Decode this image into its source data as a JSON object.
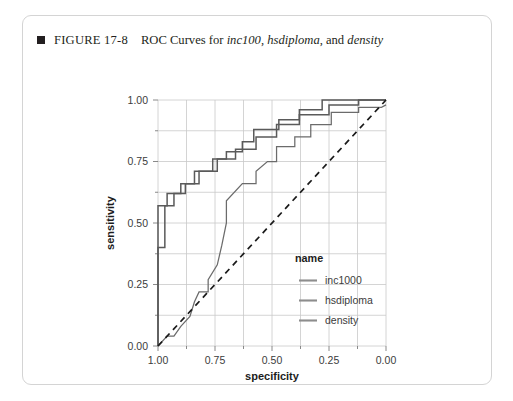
{
  "figure": {
    "marker_icon": "filled-square-icon",
    "number_label": "FIGURE 17-8",
    "caption_prefix": "ROC Curves for ",
    "caption_var1": "inc100",
    "caption_sep1": ", ",
    "caption_var2": "hsdiploma",
    "caption_sep2": ", and ",
    "caption_var3": "density",
    "caption_plain": "ROC Curves for inc100, hsdiploma, and density"
  },
  "chart_data": {
    "type": "line",
    "title": "ROC Curves for inc100, hsdiploma, and density",
    "xlabel": "specificity",
    "ylabel": "sensitivity",
    "xlim": [
      1.0,
      0.0
    ],
    "ylim": [
      0.0,
      1.0
    ],
    "x_reversed": true,
    "grid": true,
    "xticks": [
      1.0,
      0.75,
      0.5,
      0.25,
      0.0
    ],
    "xtick_labels": [
      "1.00",
      "0.75",
      "0.50",
      "0.25",
      "0.00"
    ],
    "x_minor_ticks": [
      0.875,
      0.625,
      0.375,
      0.125
    ],
    "yticks": [
      0.0,
      0.25,
      0.5,
      0.75,
      1.0
    ],
    "ytick_labels": [
      "0.00",
      "0.25",
      "0.50",
      "0.75",
      "1.00"
    ],
    "y_minor_ticks": [
      0.125,
      0.375,
      0.625,
      0.875
    ],
    "legend": {
      "title": "name",
      "position": "inside-right-lower",
      "entries": [
        {
          "label": "inc1000",
          "color": "#6b6b6b"
        },
        {
          "label": "hsdiploma",
          "color": "#6b6b6b"
        },
        {
          "label": "density",
          "color": "#6b6b6b"
        }
      ]
    },
    "reference_line": {
      "name": "chance-diagonal",
      "style": "dashed",
      "color": "#1a1a1a",
      "points": [
        [
          1.0,
          0.0
        ],
        [
          0.0,
          1.0
        ]
      ]
    },
    "series": [
      {
        "name": "inc1000",
        "color": "#6b6b6b",
        "points": [
          [
            1.0,
            0.0
          ],
          [
            1.0,
            0.4
          ],
          [
            0.97,
            0.4
          ],
          [
            0.97,
            0.57
          ],
          [
            0.93,
            0.57
          ],
          [
            0.93,
            0.62
          ],
          [
            0.88,
            0.62
          ],
          [
            0.88,
            0.66
          ],
          [
            0.84,
            0.66
          ],
          [
            0.84,
            0.71
          ],
          [
            0.76,
            0.71
          ],
          [
            0.76,
            0.76
          ],
          [
            0.7,
            0.76
          ],
          [
            0.7,
            0.79
          ],
          [
            0.63,
            0.79
          ],
          [
            0.63,
            0.83
          ],
          [
            0.58,
            0.83
          ],
          [
            0.58,
            0.88
          ],
          [
            0.47,
            0.88
          ],
          [
            0.47,
            0.92
          ],
          [
            0.38,
            0.92
          ],
          [
            0.38,
            0.96
          ],
          [
            0.28,
            0.96
          ],
          [
            0.28,
            1.0
          ],
          [
            0.0,
            1.0
          ]
        ]
      },
      {
        "name": "hsdiploma",
        "color": "#6b6b6b",
        "points": [
          [
            1.0,
            0.0
          ],
          [
            1.0,
            0.57
          ],
          [
            0.96,
            0.57
          ],
          [
            0.96,
            0.62
          ],
          [
            0.9,
            0.62
          ],
          [
            0.9,
            0.66
          ],
          [
            0.82,
            0.66
          ],
          [
            0.82,
            0.71
          ],
          [
            0.74,
            0.71
          ],
          [
            0.74,
            0.76
          ],
          [
            0.66,
            0.76
          ],
          [
            0.66,
            0.8
          ],
          [
            0.57,
            0.8
          ],
          [
            0.57,
            0.85
          ],
          [
            0.48,
            0.85
          ],
          [
            0.48,
            0.9
          ],
          [
            0.38,
            0.9
          ],
          [
            0.38,
            0.94
          ],
          [
            0.25,
            0.94
          ],
          [
            0.25,
            0.98
          ],
          [
            0.12,
            0.98
          ],
          [
            0.12,
            1.0
          ],
          [
            0.0,
            1.0
          ]
        ]
      },
      {
        "name": "density",
        "color": "#8d8d8d",
        "points": [
          [
            1.0,
            0.0
          ],
          [
            0.96,
            0.04
          ],
          [
            0.93,
            0.04
          ],
          [
            0.9,
            0.08
          ],
          [
            0.86,
            0.12
          ],
          [
            0.84,
            0.18
          ],
          [
            0.82,
            0.22
          ],
          [
            0.78,
            0.22
          ],
          [
            0.78,
            0.27
          ],
          [
            0.74,
            0.33
          ],
          [
            0.72,
            0.41
          ],
          [
            0.7,
            0.5
          ],
          [
            0.7,
            0.59
          ],
          [
            0.63,
            0.66
          ],
          [
            0.57,
            0.66
          ],
          [
            0.57,
            0.71
          ],
          [
            0.52,
            0.75
          ],
          [
            0.48,
            0.75
          ],
          [
            0.48,
            0.81
          ],
          [
            0.4,
            0.81
          ],
          [
            0.4,
            0.85
          ],
          [
            0.33,
            0.85
          ],
          [
            0.33,
            0.9
          ],
          [
            0.24,
            0.9
          ],
          [
            0.24,
            0.95
          ],
          [
            0.12,
            0.95
          ],
          [
            0.12,
            0.97
          ],
          [
            0.02,
            0.97
          ],
          [
            0.0,
            0.98
          ]
        ]
      }
    ]
  }
}
